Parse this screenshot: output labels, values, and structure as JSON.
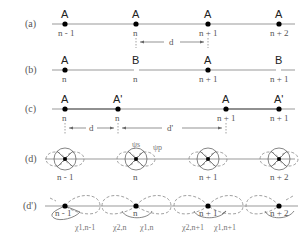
{
  "panels": {
    "a": {
      "label": "(a)",
      "atoms": [
        "A",
        "A",
        "A",
        "A"
      ],
      "indices": [
        "n - 1",
        "n",
        "n + 1",
        "n + 2"
      ],
      "spacing_label": "d"
    },
    "b": {
      "label": "(b)",
      "atoms": [
        "A",
        "B",
        "A",
        "B"
      ],
      "indices": [
        "n",
        "n",
        "n + 1",
        "n + 1"
      ]
    },
    "c": {
      "label": "(c)",
      "atoms": [
        "A",
        "A'",
        "A",
        "A'"
      ],
      "indices": [
        "n",
        "n",
        "n + 1",
        "n + 1"
      ],
      "spacing_label_1": "d",
      "spacing_label_2": "d'"
    },
    "d": {
      "label": "(d)",
      "indices": [
        "n - 1",
        "n",
        "n + 1",
        "n + 2"
      ],
      "orbital_s": "ψs",
      "orbital_p": "ψp"
    },
    "dprime": {
      "label": "(d')",
      "indices": [
        "n - 1",
        "n",
        "n + 1",
        "n + 2"
      ],
      "chi_labels": [
        "χ1,n-1",
        "χ2,n",
        "χ1,n",
        "χ2,n+1",
        "χ1,n+1"
      ]
    }
  },
  "colors": {
    "line": "#999999",
    "dot": "#000000",
    "text": "#333333"
  }
}
